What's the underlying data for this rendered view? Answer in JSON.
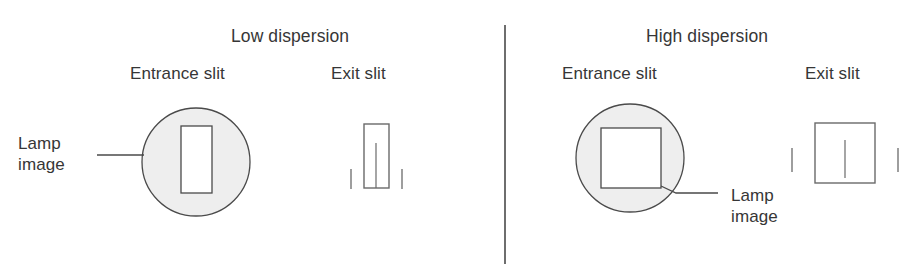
{
  "figure": {
    "width": 916,
    "height": 266,
    "background": "#ffffff",
    "stroke_color": "#4a4a4a",
    "lamp_fill_color": "#eeeeee",
    "slit_fill_color": "#ffffff",
    "divider": {
      "label": "panel-divider",
      "x": 505,
      "y_top": 25,
      "y_bottom": 264
    }
  },
  "panels": [
    {
      "id": "low-dispersion",
      "title": "Low dispersion",
      "entrance_label": "Entrance slit",
      "exit_label": "Exit slit",
      "lamp_label": "Lamp\nimage",
      "entrance": {
        "lamp_circle": {
          "cx": 196,
          "cy": 162,
          "r": 54
        },
        "slit_rect": {
          "x": 181,
          "y": 126,
          "width": 31,
          "height": 67
        },
        "shape": "tall-narrow-rectangle"
      },
      "exit": {
        "slit_rect": {
          "x": 364,
          "y": 124,
          "width": 25,
          "height": 64
        },
        "image_line": {
          "x": 376,
          "y_top": 143,
          "y_bottom": 188
        },
        "ticks": [
          {
            "x": 351,
            "y_top": 169,
            "y_bottom": 189
          },
          {
            "x": 402,
            "y_top": 169,
            "y_bottom": 189
          }
        ],
        "shape": "tall-narrow-rectangle"
      },
      "leader": {
        "type": "horizontal",
        "x1": 97,
        "y1": 155,
        "x2": 144,
        "y2": 155
      }
    },
    {
      "id": "high-dispersion",
      "title": "High dispersion",
      "entrance_label": "Entrance slit",
      "exit_label": "Exit slit",
      "lamp_label": "Lamp\nimage",
      "entrance": {
        "lamp_circle": {
          "cx": 630,
          "cy": 158,
          "r": 54
        },
        "slit_rect": {
          "x": 601,
          "y": 128,
          "width": 60,
          "height": 60
        },
        "shape": "square"
      },
      "exit": {
        "slit_rect": {
          "x": 815,
          "y": 123,
          "width": 60,
          "height": 60
        },
        "image_line": {
          "x": 845,
          "y_top": 140,
          "y_bottom": 178
        },
        "ticks": [
          {
            "x": 792,
            "y_top": 148,
            "y_bottom": 172
          },
          {
            "x": 898,
            "y_top": 148,
            "y_bottom": 172
          }
        ],
        "shape": "square"
      },
      "leader": {
        "type": "diagonal",
        "x1": 661,
        "y1": 186,
        "x2": 676,
        "y2": 193,
        "x3": 718,
        "y3": 193
      }
    }
  ],
  "text_positions": {
    "low_title": {
      "x": 231,
      "y": 26
    },
    "low_entrance": {
      "x": 130,
      "y": 63
    },
    "low_exit": {
      "x": 331,
      "y": 63
    },
    "low_lamp": {
      "x": 18,
      "y": 133
    },
    "high_title": {
      "x": 646,
      "y": 26
    },
    "high_entrance": {
      "x": 562,
      "y": 63
    },
    "high_exit": {
      "x": 805,
      "y": 63
    },
    "high_lamp": {
      "x": 731,
      "y": 185
    }
  }
}
